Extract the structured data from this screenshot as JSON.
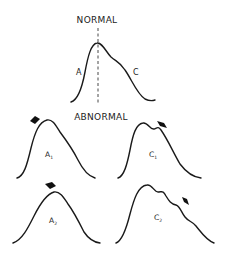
{
  "diagram": {
    "normal": {
      "heading": "NORMAL",
      "left_label": "A",
      "right_label": "C"
    },
    "abnormal": {
      "heading": "ABNORMAL",
      "panels": [
        {
          "label_main": "A",
          "label_sub": "1",
          "arrow": "pointing up-left toward peak of ascending limb"
        },
        {
          "label_main": "C",
          "label_sub": "1",
          "arrow": "pointing down-right to notch near peak"
        },
        {
          "label_main": "A",
          "label_sub": "2",
          "arrow": "pointing down onto rounded peak"
        },
        {
          "label_main": "C",
          "label_sub": "2",
          "arrow": "pointing to undulating descending limb"
        }
      ]
    },
    "colors": {
      "stroke": "#1a1a1a",
      "background": "#ffffff"
    }
  }
}
